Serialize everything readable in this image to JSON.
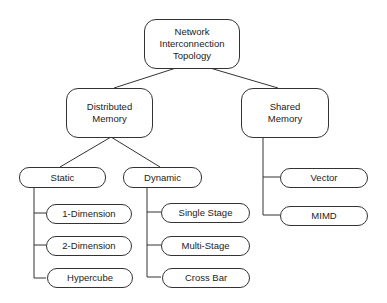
{
  "diagram": {
    "root": {
      "label": "Network\nInterconnection\nTopology"
    },
    "distributed": {
      "label": "Distributed\nMemory"
    },
    "shared": {
      "label": "Shared\nMemory"
    },
    "static": {
      "label": "Static"
    },
    "dynamic": {
      "label": "Dynamic"
    },
    "static_children": [
      "1-Dimension",
      "2-Dimension",
      "Hypercube"
    ],
    "dynamic_children": [
      "Single Stage",
      "Multi-Stage",
      "Cross Bar"
    ],
    "shared_children": [
      "Vector",
      "MIMD"
    ]
  }
}
